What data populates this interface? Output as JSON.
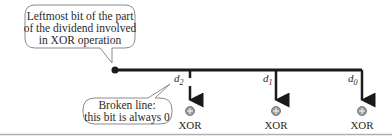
{
  "callouts": {
    "top": {
      "lines": [
        "Leftmost bit of the part",
        "of the dividend involved",
        "in XOR operation"
      ]
    },
    "bottom": {
      "lines": [
        "Broken line:",
        "this bit is always 0"
      ]
    }
  },
  "bits": [
    {
      "label": "d",
      "sub": "2",
      "op": "XOR",
      "broken": true
    },
    {
      "label": "d",
      "sub": "1",
      "op": "XOR",
      "broken": false
    },
    {
      "label": "d",
      "sub": "0",
      "op": "XOR",
      "broken": false
    }
  ],
  "colors": {
    "line": "#1a1a1a",
    "callout_border": "#8a8a8a",
    "xor_fill": "#9a9a9a",
    "rule": "#b0b0b0"
  }
}
